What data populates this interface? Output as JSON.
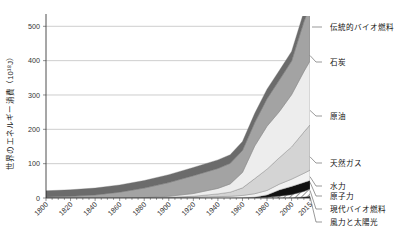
{
  "chart_data": {
    "type": "area",
    "title": "",
    "xlabel": "",
    "ylabel": "世界のエネルギー消費（10¹⁸J）",
    "xlim": [
      1800,
      2015
    ],
    "ylim": [
      0,
      530
    ],
    "grid": true,
    "legend_position": "right-outside-leader-lines",
    "stacked": true,
    "xticks": [
      "1800",
      "1820",
      "1840",
      "1860",
      "1880",
      "1900",
      "1920",
      "1940",
      "1960",
      "1980",
      "2000",
      "2015"
    ],
    "yticks": [
      "0",
      "100",
      "200",
      "300",
      "400",
      "500"
    ],
    "x": [
      1800,
      1820,
      1840,
      1860,
      1880,
      1900,
      1920,
      1940,
      1950,
      1960,
      1970,
      1980,
      1990,
      2000,
      2010,
      2015
    ],
    "series": [
      {
        "name": "風力と太陽光",
        "color": "#1a1a1a",
        "pattern": "solid",
        "values": [
          0,
          0,
          0,
          0,
          0,
          0,
          0,
          0,
          0,
          0,
          0,
          0,
          0.3,
          0.8,
          3,
          6
        ]
      },
      {
        "name": "現代バイオ燃料",
        "color": "#ffffff",
        "pattern": "diagonal-hatch",
        "values": [
          0,
          0,
          0,
          0,
          0,
          0,
          0,
          0,
          0,
          0,
          0.5,
          2,
          5,
          9,
          16,
          20
        ]
      },
      {
        "name": "原子力",
        "color": "#111111",
        "pattern": "solid",
        "values": [
          0,
          0,
          0,
          0,
          0,
          0,
          0,
          0,
          0,
          0.5,
          2,
          7,
          18,
          24,
          26,
          25
        ]
      },
      {
        "name": "水力",
        "color": "#f2f2f2",
        "pattern": "solid",
        "values": [
          0,
          0,
          0,
          0,
          0,
          1,
          2,
          4,
          5,
          7,
          10,
          13,
          17,
          21,
          27,
          30
        ]
      },
      {
        "name": "天然ガス",
        "color": "#d4d4d4",
        "pattern": "solid",
        "values": [
          0,
          0,
          0,
          0,
          0,
          1,
          3,
          8,
          12,
          22,
          44,
          62,
          77,
          94,
          120,
          132
        ]
      },
      {
        "name": "原油",
        "color": "#ededed",
        "pattern": "solid",
        "values": [
          0,
          0,
          0,
          0,
          1,
          3,
          8,
          16,
          24,
          45,
          95,
          125,
          134,
          152,
          176,
          186
        ]
      },
      {
        "name": "石炭",
        "color": "#a3a3a3",
        "pattern": "solid",
        "values": [
          3,
          5,
          9,
          17,
          28,
          40,
          52,
          58,
          60,
          64,
          68,
          80,
          92,
          98,
          145,
          160
        ]
      },
      {
        "name": "伝統的バイオ燃料",
        "color": "#6b6b6b",
        "pattern": "solid",
        "values": [
          18,
          19,
          20,
          21,
          22,
          23,
          24,
          25,
          25,
          26,
          27,
          28,
          28,
          28,
          29,
          30
        ]
      }
    ],
    "legend_labels": [
      {
        "name": "伝統的バイオ燃料",
        "anchor_value": 505
      },
      {
        "name": "石炭",
        "anchor_value": 415
      },
      {
        "name": "原油",
        "anchor_value": 255
      },
      {
        "name": "天然ガス",
        "anchor_value": 120
      },
      {
        "name": "水力",
        "anchor_value": 62
      },
      {
        "name": "原子力",
        "anchor_value": 46
      },
      {
        "name": "現代バイオ燃料",
        "anchor_value": 22
      },
      {
        "name": "風力と太陽光",
        "anchor_value": 4
      }
    ]
  }
}
